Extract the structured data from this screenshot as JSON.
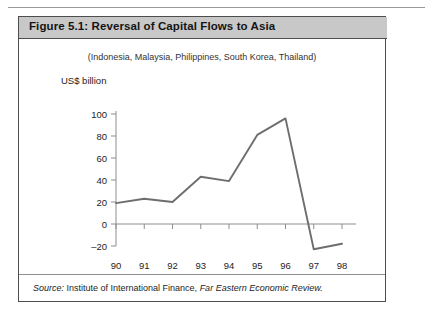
{
  "figure": {
    "title": "Figure 5.1:  Reversal of Capital Flows to Asia",
    "header_bg": "#c8c8c8",
    "border_color": "#4d4d4d"
  },
  "source": {
    "prefix": "Source:",
    "publisher": " Institute of International Finance, ",
    "journal": "Far Eastern Economic Review."
  },
  "chart_data": {
    "type": "line",
    "title": "Figure 5.1:  Reversal of Capital Flows to Asia",
    "subtitle": "(Indonesia, Malaysia, Philippines, South Korea, Thailand)",
    "xlabel": "",
    "ylabel": "US$ billion",
    "categories": [
      "90",
      "91",
      "92",
      "93",
      "94",
      "95",
      "96",
      "97",
      "98"
    ],
    "values": [
      19,
      23,
      20,
      43,
      39,
      81,
      96,
      -23,
      -18
    ],
    "ylim": [
      -20,
      100
    ],
    "yticks": [
      -20,
      0,
      20,
      40,
      60,
      80,
      100
    ],
    "ytick_labels": [
      "–20",
      "0",
      "20",
      "40",
      "60",
      "80",
      "100"
    ],
    "grid": false,
    "legend": "none",
    "line_color": "#6e6e6e",
    "axis_color": "#8d8d8d",
    "zero_line": 0
  }
}
